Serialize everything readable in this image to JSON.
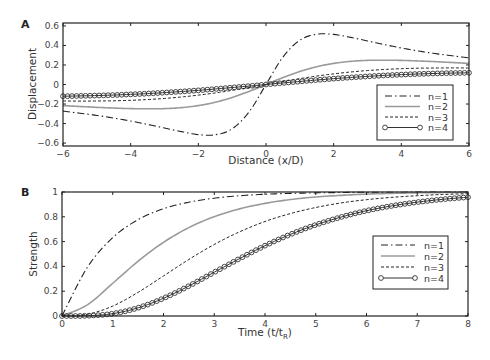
{
  "chart_data": [
    {
      "panel": "A",
      "type": "line",
      "title": "",
      "xlabel": "Distance (x/D)",
      "ylabel": "Displacement",
      "xlim": [
        -6,
        6
      ],
      "ylim": [
        -0.63,
        0.63
      ],
      "xticks": [
        -6,
        -4,
        -2,
        0,
        2,
        4,
        6
      ],
      "yticks": [
        -0.6,
        -0.4,
        -0.2,
        0,
        0.2,
        0.4,
        0.6
      ],
      "grid": false,
      "legend_position": "lower right",
      "x_positive": [
        0,
        0.5,
        1,
        1.5,
        2,
        2.5,
        3,
        3.5,
        4,
        4.5,
        5,
        5.5,
        6
      ],
      "symmetry": "odd",
      "series": [
        {
          "name": "n=1",
          "style": "dashdot",
          "values": [
            0,
            0.281,
            0.454,
            0.515,
            0.513,
            0.483,
            0.446,
            0.409,
            0.374,
            0.344,
            0.317,
            0.294,
            0.273
          ]
        },
        {
          "name": "n=2",
          "style": "solid-gray",
          "values": [
            0,
            0.071,
            0.133,
            0.182,
            0.216,
            0.237,
            0.247,
            0.249,
            0.247,
            0.241,
            0.234,
            0.225,
            0.216
          ]
        },
        {
          "name": "n=3",
          "style": "dashed",
          "values": [
            0,
            0.031,
            0.06,
            0.0865,
            0.109,
            0.128,
            0.143,
            0.154,
            0.162,
            0.167,
            0.169,
            0.17,
            0.169
          ]
        },
        {
          "name": "n=4",
          "style": "line-circles",
          "values": [
            0,
            0.016,
            0.031,
            0.046,
            0.06,
            0.072,
            0.083,
            0.093,
            0.101,
            0.108,
            0.113,
            0.117,
            0.12
          ]
        }
      ]
    },
    {
      "panel": "B",
      "type": "line",
      "title": "",
      "xlabel": "Time (t/t",
      "xlabel_sub": "R",
      "xlabel_end": ")",
      "ylabel": "Strength",
      "xlim": [
        0,
        8
      ],
      "ylim": [
        0,
        1
      ],
      "xticks": [
        0,
        1,
        2,
        3,
        4,
        5,
        6,
        7,
        8
      ],
      "yticks": [
        0,
        0.2,
        0.4,
        0.6,
        0.8,
        1
      ],
      "grid": false,
      "legend_position": "center right",
      "x": [
        0,
        0.5,
        1,
        1.5,
        2,
        2.5,
        3,
        3.5,
        4,
        4.5,
        5,
        5.5,
        6,
        6.5,
        7,
        7.5,
        8
      ],
      "series": [
        {
          "name": "n=1",
          "style": "dashdot",
          "values": [
            0,
            0.393,
            0.632,
            0.777,
            0.865,
            0.918,
            0.95,
            0.97,
            0.982,
            0.989,
            0.993,
            0.996,
            0.998,
            0.998,
            0.999,
            0.9994,
            0.9997
          ]
        },
        {
          "name": "n=2",
          "style": "solid-gray",
          "values": [
            0,
            0.09,
            0.264,
            0.442,
            0.594,
            0.713,
            0.801,
            0.864,
            0.908,
            0.939,
            0.96,
            0.973,
            0.983,
            0.989,
            0.993,
            0.9955,
            0.997
          ]
        },
        {
          "name": "n=3",
          "style": "dashed",
          "values": [
            0,
            0.014,
            0.08,
            0.191,
            0.323,
            0.456,
            0.577,
            0.679,
            0.762,
            0.826,
            0.875,
            0.912,
            0.938,
            0.957,
            0.97,
            0.98,
            0.986
          ]
        },
        {
          "name": "n=4",
          "style": "line-circles",
          "values": [
            0,
            0.002,
            0.019,
            0.066,
            0.143,
            0.242,
            0.353,
            0.463,
            0.567,
            0.658,
            0.735,
            0.798,
            0.849,
            0.888,
            0.918,
            0.941,
            0.958
          ]
        }
      ]
    }
  ],
  "panels": {
    "a_label": "A",
    "b_label": "B"
  },
  "colors": {
    "n1": "#222222",
    "n2": "#999999",
    "n3": "#222222",
    "n4": "#333333",
    "axis": "#222222"
  }
}
